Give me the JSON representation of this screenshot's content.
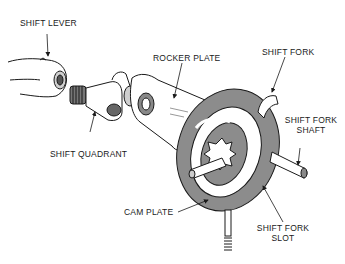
{
  "diagram": {
    "type": "mechanical-assembly-illustration",
    "colors": {
      "line": "#1a1a1a",
      "fill_gray": "#8c8c8c",
      "fill_light": "#cfcfcf",
      "background": "#ffffff"
    },
    "labels": {
      "shift_lever": "SHIFT LEVER",
      "rocker_plate": "ROCKER PLATE",
      "shift_fork": "SHIFT FORK",
      "shift_fork_shaft_1": "SHIFT FORK",
      "shift_fork_shaft_2": "SHAFT",
      "shift_quadrant": "SHIFT QUADRANT",
      "cam_plate": "CAM PLATE",
      "shift_fork_slot_1": "SHIFT FORK",
      "shift_fork_slot_2": "SLOT"
    }
  }
}
